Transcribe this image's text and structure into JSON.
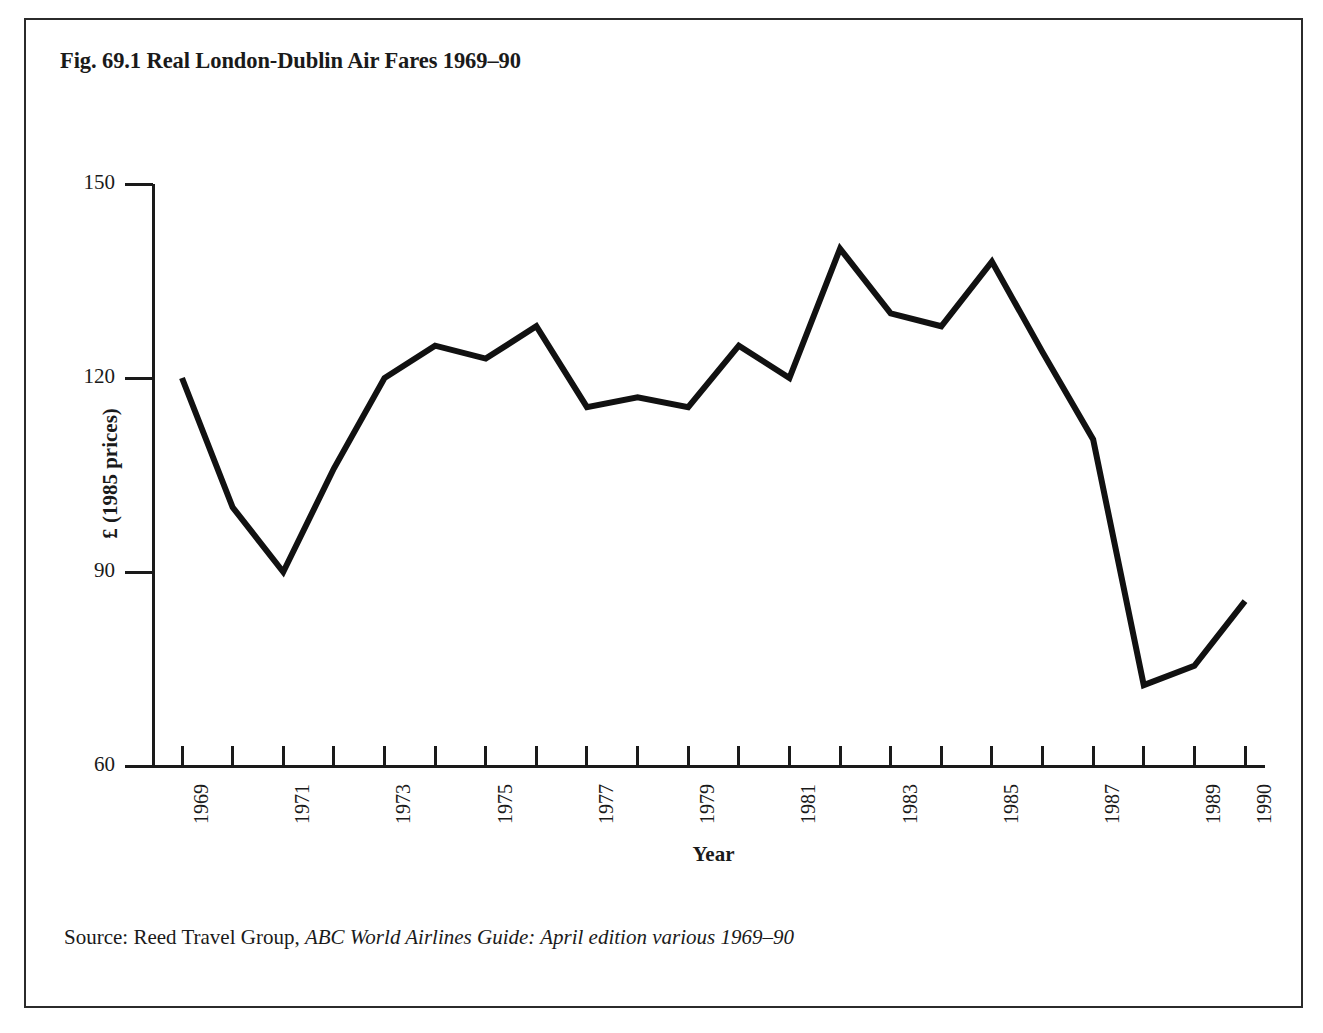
{
  "figure": {
    "title": "Fig. 69.1 Real London-Dublin Air Fares 1969–90",
    "source_prefix": "Source: Reed Travel Group, ",
    "source_italic": "ABC World Airlines Guide: April edition various 1969–90",
    "line_color": "#111111",
    "frame_color": "#2b2b2b"
  },
  "chart_data": {
    "type": "line",
    "title": "Fig. 69.1 Real London-Dublin Air Fares 1969–90",
    "xlabel": "Year",
    "ylabel": "£ (1985 prices)",
    "xlim": [
      1969,
      1990
    ],
    "ylim": [
      60,
      150
    ],
    "grid": false,
    "legend": "none",
    "x": [
      1969,
      1970,
      1971,
      1972,
      1973,
      1974,
      1975,
      1976,
      1977,
      1978,
      1979,
      1980,
      1981,
      1982,
      1983,
      1984,
      1985,
      1986,
      1987,
      1988,
      1989,
      1990
    ],
    "values": [
      120,
      100,
      90,
      106,
      120,
      125,
      123,
      128,
      115.5,
      117,
      115.5,
      125,
      120,
      140,
      130,
      128,
      138,
      124,
      110.5,
      72.5,
      75.5,
      85.5
    ],
    "yticks": [
      150,
      120,
      90,
      60
    ],
    "ytick_labels": [
      "150",
      "120",
      "90",
      "60"
    ],
    "xticks": [
      1969,
      1970,
      1971,
      1972,
      1973,
      1974,
      1975,
      1976,
      1977,
      1978,
      1979,
      1980,
      1981,
      1982,
      1983,
      1984,
      1985,
      1986,
      1987,
      1988,
      1989,
      1990
    ],
    "xtick_labels": [
      "1969",
      "",
      "1971",
      "",
      "1973",
      "",
      "1975",
      "",
      "1977",
      "",
      "1979",
      "",
      "1981",
      "",
      "1983",
      "",
      "1985",
      "",
      "1987",
      "",
      "1989",
      "1990"
    ]
  }
}
